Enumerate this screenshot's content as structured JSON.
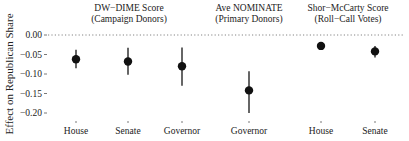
{
  "chart_data": {
    "type": "scatter",
    "subtype": "point-range (coefficient plot)",
    "ylabel": "Effect on Republican Share",
    "xlabel": "",
    "ylim": [
      -0.2,
      0.0
    ],
    "yticks": [
      0.0,
      -0.05,
      -0.1,
      -0.15,
      -0.2
    ],
    "ytick_labels": [
      "0.00",
      "-0.05",
      "-0.10",
      "-0.15",
      "-0.20"
    ],
    "reference_line": {
      "y": 0.0,
      "style": "dotted"
    },
    "grid": false,
    "legend": null,
    "panels": [
      {
        "title_line1": "DW−DIME Score",
        "title_line2": "(Campaign Donors)",
        "categories": [
          "House",
          "Senate",
          "Governor"
        ],
        "estimates": [
          -0.062,
          -0.068,
          -0.08
        ],
        "ci_low": [
          -0.085,
          -0.102,
          -0.13
        ],
        "ci_high": [
          -0.038,
          -0.033,
          -0.032
        ]
      },
      {
        "title_line1": "Ave NOMINATE",
        "title_line2": "(Primary Donors)",
        "categories": [
          "Governor"
        ],
        "estimates": [
          -0.142
        ],
        "ci_low": [
          -0.2
        ],
        "ci_high": [
          -0.093
        ]
      },
      {
        "title_line1": "Shor−McCarty Score",
        "title_line2": "(Roll−Call Votes)",
        "categories": [
          "House",
          "Senate"
        ],
        "estimates": [
          -0.028,
          -0.042
        ],
        "ci_low": [
          -0.035,
          -0.058
        ],
        "ci_high": [
          -0.02,
          -0.028
        ]
      }
    ]
  },
  "layout": {
    "x_positions": [
      [
        76,
        128,
        182
      ],
      [
        249
      ],
      [
        321,
        375
      ]
    ],
    "title_centers": [
      129,
      249,
      348
    ],
    "plot_left": 48,
    "plot_right": 405,
    "y_zero_px": 35,
    "y_min_px": 113,
    "colors": {
      "point": "#111111",
      "bar": "#333333",
      "ref": "#666666",
      "text": "#222222"
    }
  }
}
